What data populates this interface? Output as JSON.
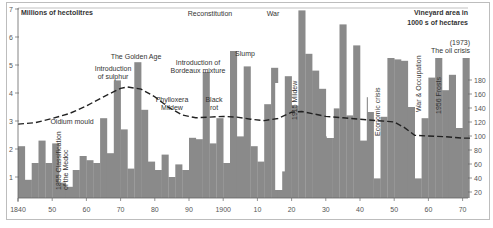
{
  "chart_data": {
    "type": "bar",
    "title": "",
    "ylabel": "Millions of hectolitres",
    "ylabel_right": "Vineyard area in 1000 s of hectares",
    "xlabel": "",
    "ylim": [
      0.25,
      7
    ],
    "ylim_right": [
      0,
      200
    ],
    "x_ticks": [
      "1840",
      "50",
      "60",
      "70",
      "80",
      "90",
      "1900",
      "10",
      "20",
      "30",
      "40",
      "50",
      "60",
      "70"
    ],
    "y_ticks": [
      "1",
      "2",
      "3",
      "4",
      "5",
      "6",
      "7"
    ],
    "y_ticks_right": [
      "20",
      "40",
      "60",
      "80",
      "100",
      "120",
      "140",
      "160",
      "180"
    ],
    "grid": false,
    "bar_series": {
      "name": "Wine production (millions of hectolitres)",
      "years": [
        1840,
        1842,
        1844,
        1846,
        1848,
        1850,
        1852,
        1854,
        1856,
        1858,
        1860,
        1862,
        1864,
        1866,
        1868,
        1870,
        1872,
        1874,
        1876,
        1878,
        1880,
        1882,
        1884,
        1886,
        1888,
        1890,
        1892,
        1894,
        1896,
        1898,
        1900,
        1902,
        1904,
        1906,
        1908,
        1910,
        1912,
        1914,
        1916,
        1918,
        1920,
        1922,
        1924,
        1926,
        1928,
        1930,
        1932,
        1934,
        1936,
        1938,
        1940,
        1942,
        1944,
        1946,
        1948,
        1950,
        1952,
        1954,
        1956,
        1958,
        1960,
        1962,
        1964,
        1966,
        1968,
        1970
      ],
      "values": [
        2.1,
        0.9,
        1.5,
        2.3,
        1.5,
        2.2,
        0.8,
        0.65,
        1.25,
        1.75,
        1.6,
        1.5,
        3.1,
        1.85,
        4.45,
        2.7,
        1.3,
        5.1,
        3.4,
        1.55,
        1.25,
        1.8,
        1.0,
        1.45,
        1.25,
        2.4,
        2.35,
        4.75,
        2.2,
        3.1,
        1.5,
        5.5,
        2.45,
        4.95,
        2.1,
        1.55,
        3.6,
        4.9,
        1.2,
        4.6,
        3.55,
        6.95,
        5.4,
        4.8,
        4.15,
        2.45,
        3.45,
        6.45,
        3.2,
        5.7,
        2.3,
        3.85,
        0.95,
        3.15,
        5.25,
        5.2,
        5.15,
        3.5,
        0.95,
        3.1,
        4.55,
        5.25,
        4.1,
        4.65,
        2.75,
        5.25
      ]
    },
    "line_series": {
      "name": "Vineyard area (1000s of hectares)",
      "style": "dashed",
      "points": [
        [
          1840,
          117
        ],
        [
          1845,
          119
        ],
        [
          1850,
          125
        ],
        [
          1855,
          132
        ],
        [
          1860,
          143
        ],
        [
          1865,
          156
        ],
        [
          1870,
          168
        ],
        [
          1872,
          170
        ],
        [
          1876,
          167
        ],
        [
          1880,
          156
        ],
        [
          1884,
          141
        ],
        [
          1888,
          130
        ],
        [
          1892,
          126
        ],
        [
          1896,
          127
        ],
        [
          1900,
          128
        ],
        [
          1904,
          127
        ],
        [
          1908,
          124
        ],
        [
          1912,
          122
        ],
        [
          1916,
          125
        ],
        [
          1920,
          134
        ],
        [
          1923,
          135
        ],
        [
          1926,
          132
        ],
        [
          1930,
          128
        ],
        [
          1935,
          126
        ],
        [
          1940,
          124
        ],
        [
          1945,
          122
        ],
        [
          1950,
          120
        ],
        [
          1953,
          112
        ],
        [
          1956,
          101
        ],
        [
          1960,
          100
        ],
        [
          1965,
          99
        ],
        [
          1970,
          97
        ],
        [
          1973,
          97
        ]
      ]
    },
    "annotations": [
      {
        "text": "Oidium mould",
        "year": 1852
      },
      {
        "text": "1855 Classification of the Medoc",
        "year": 1855,
        "orientation": "vertical"
      },
      {
        "text": "Introduction of sulphur",
        "year": 1868
      },
      {
        "text": "The Golden Age",
        "year": 1875
      },
      {
        "text": "Phylloxera Mildew",
        "year": 1886
      },
      {
        "text": "Introduction of Bordeaux mixture",
        "year": 1892
      },
      {
        "text": "Black rot",
        "year": 1897
      },
      {
        "text": "Reconstitution",
        "year": 1900
      },
      {
        "text": "Slump",
        "year": 1906
      },
      {
        "text": "1915 Mildew",
        "year": 1915,
        "orientation": "vertical"
      },
      {
        "text": "War",
        "year": 1916
      },
      {
        "text": "Economic crisis",
        "year": 1930,
        "orientation": "vertical"
      },
      {
        "text": "War & Occupation",
        "year": 1942,
        "orientation": "vertical"
      },
      {
        "text": "1956 Frosts",
        "year": 1956,
        "orientation": "vertical"
      },
      {
        "text": "(1973) The oil crisis",
        "year": 1973
      }
    ],
    "legend_position": "none"
  },
  "labels": {
    "left_axis_title": "Millions of hectolitres",
    "right_axis_title_line1": "Vineyard area in",
    "right_axis_title_line2": "1000 s of hectares"
  }
}
